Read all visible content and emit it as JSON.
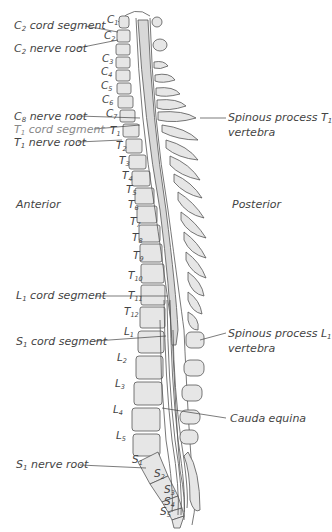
{
  "diagram": {
    "orientation": {
      "left": "Anterior",
      "right": "Posterior"
    },
    "colors": {
      "line": "#444444",
      "cord_fill": "#d9d9d9",
      "bone_fill": "#e8e8e8",
      "label": "#444444",
      "label_gray": "#888888"
    },
    "left_labels": [
      {
        "id": "c2-cord",
        "prefix": "C",
        "sub": "2",
        "text": " cord segment"
      },
      {
        "id": "c2-root",
        "prefix": "C",
        "sub": "2",
        "text": " nerve root"
      },
      {
        "id": "c8-root",
        "prefix": "C",
        "sub": "8",
        "text": " nerve root"
      },
      {
        "id": "t1-cord",
        "prefix": "T",
        "sub": "1",
        "text": " cord segment"
      },
      {
        "id": "t1-root",
        "prefix": "T",
        "sub": "1",
        "text": " nerve root"
      },
      {
        "id": "l1-cord",
        "prefix": "L",
        "sub": "1",
        "text": " cord segment"
      },
      {
        "id": "s1-cord",
        "prefix": "S",
        "sub": "1",
        "text": " cord segment"
      },
      {
        "id": "s1-root",
        "prefix": "S",
        "sub": "1",
        "text": " nerve root"
      }
    ],
    "right_labels": [
      {
        "id": "sp-t1",
        "line1_text": "Spinous process ",
        "line1_prefix": "T",
        "line1_sub": "1",
        "line2": "vertebra"
      },
      {
        "id": "sp-l1",
        "line1_text": "Spinous process ",
        "line1_prefix": "L",
        "line1_sub": "1",
        "line2": "vertebra"
      },
      {
        "id": "cauda",
        "text": "Cauda equina"
      }
    ],
    "vertebrae": [
      {
        "p": "C",
        "s": "1"
      },
      {
        "p": "C",
        "s": "2"
      },
      {
        "p": "C",
        "s": "3"
      },
      {
        "p": "C",
        "s": "4"
      },
      {
        "p": "C",
        "s": "5"
      },
      {
        "p": "C",
        "s": "6"
      },
      {
        "p": "C",
        "s": "7"
      },
      {
        "p": "T",
        "s": "1"
      },
      {
        "p": "T",
        "s": "2"
      },
      {
        "p": "T",
        "s": "3"
      },
      {
        "p": "T",
        "s": "4"
      },
      {
        "p": "T",
        "s": "5"
      },
      {
        "p": "T",
        "s": "6"
      },
      {
        "p": "T",
        "s": "7"
      },
      {
        "p": "T",
        "s": "8"
      },
      {
        "p": "T",
        "s": "9"
      },
      {
        "p": "T",
        "s": "10"
      },
      {
        "p": "T",
        "s": "11"
      },
      {
        "p": "T",
        "s": "12"
      },
      {
        "p": "L",
        "s": "1"
      },
      {
        "p": "L",
        "s": "2"
      },
      {
        "p": "L",
        "s": "3"
      },
      {
        "p": "L",
        "s": "4"
      },
      {
        "p": "L",
        "s": "5"
      },
      {
        "p": "S",
        "s": "1"
      },
      {
        "p": "S",
        "s": "2"
      },
      {
        "p": "S",
        "s": "3"
      },
      {
        "p": "S",
        "s": "4"
      },
      {
        "p": "S",
        "s": "5"
      }
    ]
  }
}
